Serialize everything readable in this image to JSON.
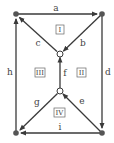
{
  "diagram": {
    "type": "directed-graph",
    "colors": {
      "edge": "#3a3a3a",
      "node_filled": "#555555",
      "node_open": "#ffffff"
    },
    "nodes": [
      {
        "id": "TL",
        "x": 16,
        "y": 14,
        "style": "filled"
      },
      {
        "id": "TR",
        "x": 102,
        "y": 14,
        "style": "filled"
      },
      {
        "id": "CT",
        "x": 60,
        "y": 54,
        "style": "open"
      },
      {
        "id": "CB",
        "x": 60,
        "y": 91,
        "style": "open"
      },
      {
        "id": "BL",
        "x": 16,
        "y": 133,
        "style": "filled"
      },
      {
        "id": "BR",
        "x": 102,
        "y": 133,
        "style": "filled"
      }
    ],
    "edges": [
      {
        "label": "a",
        "from": "TL",
        "to": "TR"
      },
      {
        "label": "b",
        "from": "TR",
        "to": "CT"
      },
      {
        "label": "c",
        "from": "CT",
        "to": "TL"
      },
      {
        "label": "d",
        "from": "TR",
        "to": "BR"
      },
      {
        "label": "e",
        "from": "BR",
        "to": "CB"
      },
      {
        "label": "f",
        "from": "CB",
        "to": "CT"
      },
      {
        "label": "g",
        "from": "CB",
        "to": "BL"
      },
      {
        "label": "h",
        "from": "BL",
        "to": "TL"
      },
      {
        "label": "i",
        "from": "BR",
        "to": "BL"
      }
    ],
    "regions": [
      "I",
      "II",
      "III",
      "IV"
    ]
  }
}
